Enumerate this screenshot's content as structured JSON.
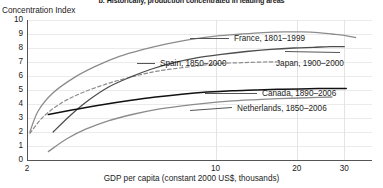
{
  "chart_data": {
    "type": "line",
    "title": "b. Historically, production concentrated in leading areas",
    "ylabel": "Concentration Index",
    "xlabel": "GDP per capita (constant 2000 US$, thousands)",
    "xscale": "log",
    "xlim": [
      2,
      38
    ],
    "ylim": [
      0,
      10
    ],
    "xticks": [
      2,
      10,
      20,
      30
    ],
    "xtick_labels": [
      "2",
      "10",
      "20",
      "30"
    ],
    "yticks": [
      0,
      1,
      2,
      3,
      4,
      5,
      6,
      7,
      8,
      9,
      10
    ],
    "ytick_labels": [
      "0",
      "1",
      "2",
      "3",
      "4",
      "5",
      "6",
      "7",
      "8",
      "9",
      "10"
    ],
    "grid": "both-faint",
    "legend_position": "inline-annotations",
    "series": [
      {
        "name": "France, 1801–1999",
        "label": "France, 1801–1999",
        "style": "solid",
        "color": "#8c8c8c",
        "width": 1.3,
        "points": [
          [
            2.05,
            2.0
          ],
          [
            2.2,
            3.5
          ],
          [
            2.5,
            4.8
          ],
          [
            3.0,
            5.9
          ],
          [
            3.6,
            6.7
          ],
          [
            4.4,
            7.4
          ],
          [
            5.4,
            7.9
          ],
          [
            6.6,
            8.3
          ],
          [
            8.0,
            8.6
          ],
          [
            10.0,
            8.85
          ],
          [
            12.5,
            9.0
          ],
          [
            15.0,
            9.1
          ],
          [
            18.0,
            9.15
          ],
          [
            21.0,
            9.15
          ],
          [
            24.0,
            9.1
          ],
          [
            27.0,
            9.0
          ],
          [
            30.0,
            8.9
          ],
          [
            33.0,
            8.75
          ]
        ]
      },
      {
        "name": "Spain, 1850–2000",
        "label": "Spain, 1850–2000",
        "style": "dashed",
        "color": "#8c8c8c",
        "width": 1.2,
        "points": [
          [
            2.05,
            1.9
          ],
          [
            2.3,
            3.1
          ],
          [
            2.7,
            4.1
          ],
          [
            3.2,
            4.8
          ],
          [
            3.9,
            5.4
          ],
          [
            4.8,
            5.9
          ],
          [
            5.9,
            6.3
          ],
          [
            7.2,
            6.55
          ],
          [
            8.8,
            6.75
          ],
          [
            10.5,
            6.9
          ],
          [
            12.5,
            6.95
          ],
          [
            15.0,
            7.0
          ],
          [
            17.5,
            7.0
          ]
        ]
      },
      {
        "name": "Japan, 1900–2000",
        "label": "Japan, 1900–2000",
        "style": "solid",
        "color": "#4d4d4d",
        "width": 1.3,
        "points": [
          [
            2.5,
            2.0
          ],
          [
            2.9,
            3.2
          ],
          [
            3.4,
            4.3
          ],
          [
            4.0,
            5.2
          ],
          [
            4.8,
            5.9
          ],
          [
            5.8,
            6.5
          ],
          [
            7.0,
            6.95
          ],
          [
            8.5,
            7.3
          ],
          [
            10.5,
            7.55
          ],
          [
            13.0,
            7.75
          ],
          [
            16.0,
            7.9
          ],
          [
            19.5,
            8.0
          ],
          [
            23.0,
            8.05
          ],
          [
            26.5,
            8.1
          ],
          [
            30.0,
            8.1
          ]
        ]
      },
      {
        "name": "Canada, 1890–2006",
        "label": "Canada, 1890–2006",
        "style": "solid",
        "color": "#111111",
        "width": 1.5,
        "points": [
          [
            2.4,
            3.25
          ],
          [
            3.0,
            3.6
          ],
          [
            3.8,
            3.95
          ],
          [
            4.8,
            4.25
          ],
          [
            6.0,
            4.5
          ],
          [
            7.5,
            4.7
          ],
          [
            9.3,
            4.85
          ],
          [
            11.5,
            4.95
          ],
          [
            14.0,
            5.0
          ],
          [
            17.0,
            5.05
          ],
          [
            20.5,
            5.08
          ],
          [
            24.0,
            5.1
          ],
          [
            27.5,
            5.1
          ],
          [
            30.5,
            5.1
          ]
        ]
      },
      {
        "name": "Netherlands, 1850–2006",
        "label": "Netherlands, 1850–2006",
        "style": "solid",
        "color": "#8c8c8c",
        "width": 1.3,
        "points": [
          [
            2.4,
            0.6
          ],
          [
            2.8,
            1.5
          ],
          [
            3.3,
            2.2
          ],
          [
            4.0,
            2.8
          ],
          [
            4.9,
            3.25
          ],
          [
            6.0,
            3.6
          ],
          [
            7.4,
            3.85
          ],
          [
            9.1,
            4.05
          ],
          [
            11.2,
            4.2
          ],
          [
            13.8,
            4.3
          ],
          [
            17.0,
            4.38
          ],
          [
            20.5,
            4.43
          ],
          [
            24.0,
            4.47
          ],
          [
            27.0,
            4.5
          ]
        ]
      }
    ],
    "annotations": [
      {
        "text": "France, 1801–1999",
        "x_px": 234,
        "y_px": 34
      },
      {
        "text": "Spain, 1850–2000",
        "x_px": 160,
        "y_px": 59
      },
      {
        "text": "Japan, 1900–2000",
        "x_px": 276,
        "y_px": 59
      },
      {
        "text": "Canada, 1890–2006",
        "x_px": 262,
        "y_px": 89
      },
      {
        "text": "Netherlands, 1850–2006",
        "x_px": 237,
        "y_px": 104
      }
    ],
    "leader_lines": [
      {
        "x1": 190,
        "y1": 38,
        "x2": 229,
        "y2": 38
      },
      {
        "x1": 137,
        "y1": 63,
        "x2": 155,
        "y2": 63
      },
      {
        "x1": 285,
        "y1": 51,
        "x2": 340,
        "y2": 52
      },
      {
        "x1": 205,
        "y1": 93,
        "x2": 257,
        "y2": 93
      },
      {
        "x1": 190,
        "y1": 110,
        "x2": 232,
        "y2": 107
      }
    ]
  }
}
